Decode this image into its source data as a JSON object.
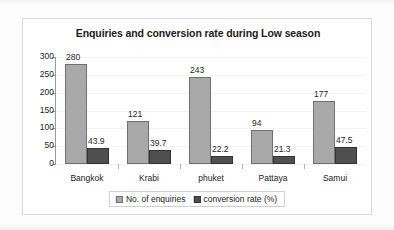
{
  "chart_data": {
    "type": "bar",
    "title": "Enquiries and conversion rate during Low season",
    "xlabel": "",
    "ylabel": "",
    "ylim": [
      0,
      300
    ],
    "yticks": [
      300,
      250,
      200,
      150,
      100,
      50,
      0
    ],
    "grid": false,
    "legend_position": "bottom",
    "categories": [
      "Bangkok",
      "Krabi",
      "phuket",
      "Pattaya",
      "Samui"
    ],
    "series": [
      {
        "name": "No. of enquiries",
        "color": "#a9a9a9",
        "values": [
          280,
          121,
          243,
          94,
          177
        ],
        "labels": [
          "280",
          "121",
          "243",
          "94",
          "177"
        ]
      },
      {
        "name": "conversion rate (%)",
        "color": "#4f4f4f",
        "values": [
          43.9,
          39.7,
          22.2,
          21.3,
          47.5
        ],
        "labels": [
          "43.9",
          "39.7",
          "22.2",
          "21.3",
          "47.5"
        ]
      }
    ]
  },
  "legend": {
    "entries": [
      {
        "label": "No. of enquiries"
      },
      {
        "label": "conversion rate (%)"
      }
    ]
  }
}
